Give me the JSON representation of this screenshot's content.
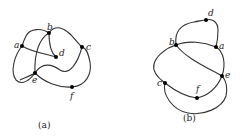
{
  "figures": [
    {
      "id": "a",
      "caption": "(a)",
      "points": [
        {
          "label": "a",
          "x": 22,
          "y": 46
        },
        {
          "label": "b",
          "x": 49,
          "y": 33
        },
        {
          "label": "c",
          "x": 82,
          "y": 47
        },
        {
          "label": "d",
          "x": 56,
          "y": 57
        },
        {
          "label": "e",
          "x": 35,
          "y": 73
        },
        {
          "label": "f",
          "x": 72,
          "y": 87
        }
      ]
    },
    {
      "id": "b",
      "caption": "(b)",
      "points": [
        {
          "label": "d",
          "x": 206,
          "y": 20
        },
        {
          "label": "b",
          "x": 176,
          "y": 45
        },
        {
          "label": "a",
          "x": 216,
          "y": 47
        },
        {
          "label": "e",
          "x": 222,
          "y": 76
        },
        {
          "label": "c",
          "x": 165,
          "y": 83
        },
        {
          "label": "f",
          "x": 197,
          "y": 98
        }
      ]
    }
  ],
  "colors": {
    "stroke": "#333333",
    "point": "#000000",
    "background": "#ffffff"
  }
}
